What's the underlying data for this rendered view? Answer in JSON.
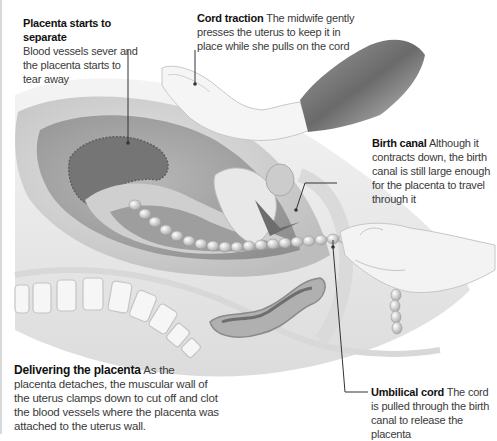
{
  "figure": {
    "colors": {
      "background": "#ffffff",
      "text": "#3a3a3a",
      "title_text": "#111111",
      "leader_line": "#333333",
      "uterus_outer": "#c9c9c9",
      "uterus_wall": "#a9a9a9",
      "placenta": "#777777",
      "cord": "#e6e6e6",
      "glove": "#6f6f6f",
      "skin": "#f2f2f2"
    }
  },
  "callouts": [
    {
      "id": "placenta-separate",
      "title": "Placenta starts to separate",
      "body": "Blood vessels sever and the placenta starts to tear away"
    },
    {
      "id": "cord-traction",
      "title": "Cord traction",
      "body": "The midwife gently presses the uterus to keep it in place while she pulls on the cord"
    },
    {
      "id": "birth-canal",
      "title": "Birth canal",
      "body": "Although it contracts down, the birth canal is still large enough for the placenta to travel through it"
    },
    {
      "id": "umbilical-cord",
      "title": "Umbilical cord",
      "body": "The cord is pulled through the birth canal to release the placenta"
    },
    {
      "id": "delivering-placenta",
      "title": "Delivering the placenta",
      "body": "As the placenta detaches, the muscular wall of the uterus clamps down to cut off and clot the blood vessels where the placenta was attached to the uterus wall."
    }
  ]
}
